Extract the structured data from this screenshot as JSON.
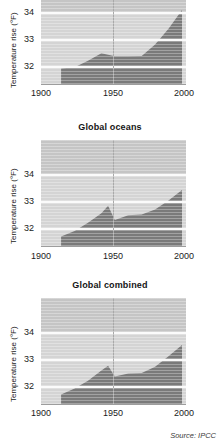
{
  "figure": {
    "source_note": "Source: IPCC"
  },
  "chart_data": [
    {
      "type": "area",
      "title": "",
      "xlabel": "",
      "ylabel": "Temperature rise (°F)",
      "xticks": [
        "1900",
        "1950",
        "2000"
      ],
      "xtick_values": [
        1900,
        1950,
        2000
      ],
      "yticks": [
        "32",
        "33",
        "34"
      ],
      "ytick_values": [
        32,
        33,
        34
      ],
      "xlim": [
        1895,
        2003
      ],
      "ylim": [
        31.2,
        34.75
      ],
      "grid": "horizontal-white-plus-vertical-1950",
      "legend": "none",
      "x": [
        1910,
        1920,
        1930,
        1940,
        1950,
        1960,
        1970,
        1980,
        1990,
        2000
      ],
      "values": [
        31.72,
        31.76,
        31.98,
        32.23,
        32.13,
        32.13,
        32.14,
        32.52,
        33.05,
        33.68
      ]
    },
    {
      "type": "area",
      "title": "Global oceans",
      "xlabel": "",
      "ylabel": "Temperature rise (°F)",
      "xticks": [
        "1900",
        "1950",
        "2000"
      ],
      "xtick_values": [
        1900,
        1950,
        2000
      ],
      "yticks": [
        "32",
        "33",
        "34"
      ],
      "ytick_values": [
        32,
        33,
        34
      ],
      "xlim": [
        1895,
        2003
      ],
      "ylim": [
        31.2,
        34.75
      ],
      "grid": "horizontal-white-plus-vertical-1950",
      "legend": "none",
      "x": [
        1910,
        1920,
        1930,
        1940,
        1945,
        1950,
        1960,
        1970,
        1980,
        1990,
        2000
      ],
      "values": [
        31.52,
        31.7,
        31.98,
        32.3,
        32.55,
        32.07,
        32.23,
        32.25,
        32.42,
        32.72,
        33.08
      ]
    },
    {
      "type": "area",
      "title": "Global combined",
      "xlabel": "",
      "ylabel": "Temperature rise (°F)",
      "xticks": [
        "1900",
        "1950",
        "2000"
      ],
      "xtick_values": [
        1900,
        1950,
        2000
      ],
      "yticks": [
        "32",
        "33",
        "34"
      ],
      "ytick_values": [
        32,
        33,
        34
      ],
      "xlim": [
        1895,
        2003
      ],
      "ylim": [
        31.2,
        34.75
      ],
      "grid": "horizontal-white-plus-vertical-1950",
      "legend": "none",
      "x": [
        1910,
        1920,
        1930,
        1940,
        1945,
        1950,
        1960,
        1970,
        1980,
        1990,
        2000
      ],
      "values": [
        31.52,
        31.72,
        31.98,
        32.32,
        32.48,
        32.12,
        32.22,
        32.24,
        32.45,
        32.8,
        33.18
      ]
    }
  ],
  "colors": {
    "area_fill": "#7a7a7a",
    "plot_background": "#d4d4d4",
    "plot_background_top": "#c5c5c5",
    "gridline": "#fbfbfb",
    "vertical_gridline": "#a9a9a9",
    "text": "#1b1b1b"
  }
}
